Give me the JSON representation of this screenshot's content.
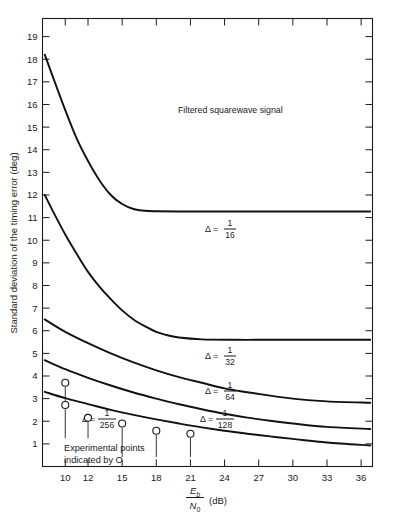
{
  "chart_data": {
    "type": "line",
    "title": "",
    "annotation": "Filtered squarewave signal",
    "xlabel_parts": {
      "numerator": "E",
      "numerator_sub": "b",
      "denominator": "N",
      "denominator_sub": "0",
      "unit": "(dB)"
    },
    "xlabel": "Eb/N0 (dB)",
    "ylabel": "Standard deviation of the timing error (deg)",
    "xlim": [
      8,
      37
    ],
    "ylim": [
      0,
      19.8
    ],
    "grid": false,
    "legend_position": "inline-labels",
    "xticks": [
      10,
      12,
      15,
      18,
      21,
      24,
      27,
      30,
      33,
      36
    ],
    "xticklabels": [
      "10",
      "12",
      "15",
      "18",
      "21",
      "24",
      "27",
      "30",
      "33",
      "36"
    ],
    "yticks": [
      1,
      2,
      3,
      4,
      5,
      6,
      7,
      8,
      9,
      10,
      11,
      12,
      13,
      14,
      15,
      16,
      17,
      18,
      19
    ],
    "yticklabels": [
      "1",
      "2",
      "3",
      "4",
      "5",
      "6",
      "7",
      "8",
      "9",
      "10",
      "11",
      "12",
      "13",
      "14",
      "15",
      "16",
      "17",
      "18",
      "19"
    ],
    "series": [
      {
        "name": "delta-1-16",
        "label_symbol": "Δ  =",
        "label_num": "1",
        "label_den": "16",
        "x": [
          8.2,
          9,
          10,
          11,
          12,
          13,
          14,
          15,
          16,
          17,
          18,
          20,
          23,
          26,
          30,
          33,
          36.8
        ],
        "y": [
          18.2,
          17.1,
          15.75,
          14.5,
          13.5,
          12.65,
          12.0,
          11.6,
          11.38,
          11.3,
          11.28,
          11.27,
          11.27,
          11.27,
          11.27,
          11.27,
          11.27
        ]
      },
      {
        "name": "delta-1-32",
        "label_symbol": "Δ  =",
        "label_num": "1",
        "label_den": "32",
        "x": [
          8.2,
          9,
          10,
          11,
          12,
          13,
          14,
          15,
          16,
          17,
          18,
          19,
          20,
          22,
          25,
          28,
          32,
          36.8
        ],
        "y": [
          12.0,
          11.2,
          10.25,
          9.4,
          8.6,
          7.95,
          7.4,
          6.9,
          6.5,
          6.2,
          5.95,
          5.8,
          5.7,
          5.62,
          5.6,
          5.6,
          5.6,
          5.6
        ]
      },
      {
        "name": "delta-1-64",
        "label_symbol": "Δ  =",
        "label_num": "1",
        "label_den": "64",
        "x": [
          8.2,
          10,
          12,
          14,
          16,
          18,
          20,
          22,
          24,
          26,
          28,
          30,
          33,
          36.8
        ],
        "y": [
          6.5,
          5.95,
          5.45,
          5.0,
          4.6,
          4.25,
          3.95,
          3.7,
          3.45,
          3.28,
          3.13,
          3.0,
          2.88,
          2.82
        ]
      },
      {
        "name": "delta-1-128",
        "label_symbol": "Δ  =",
        "label_num": "1",
        "label_den": "128",
        "x": [
          8.2,
          10,
          12,
          14,
          16,
          18,
          20,
          22,
          24,
          26,
          28,
          30,
          33,
          36.8
        ],
        "y": [
          4.7,
          4.3,
          3.92,
          3.58,
          3.27,
          3.0,
          2.75,
          2.53,
          2.33,
          2.16,
          2.02,
          1.9,
          1.75,
          1.66
        ]
      },
      {
        "name": "delta-1-256",
        "label_symbol": "Δ  =",
        "label_num": "1",
        "label_den": "256",
        "x": [
          8.2,
          10,
          12,
          14,
          16,
          18,
          20,
          22,
          24,
          26,
          28,
          30,
          33,
          36.8
        ],
        "y": [
          3.3,
          3.02,
          2.76,
          2.5,
          2.28,
          2.08,
          1.9,
          1.73,
          1.58,
          1.45,
          1.33,
          1.22,
          1.06,
          0.93
        ]
      }
    ],
    "experimental_points": {
      "note_line1": "Experimental points",
      "note_line2": "indicated by O",
      "marker": "open-circle",
      "points": [
        {
          "x": 10,
          "y": 3.7
        },
        {
          "x": 10,
          "y": 2.72
        },
        {
          "x": 12,
          "y": 2.15
        },
        {
          "x": 15,
          "y": 1.9
        },
        {
          "x": 18,
          "y": 1.58
        },
        {
          "x": 21,
          "y": 1.45
        }
      ]
    },
    "colors": {
      "ink": "#1a1a1a",
      "curve": "#111111",
      "background": "#ffffff"
    }
  }
}
